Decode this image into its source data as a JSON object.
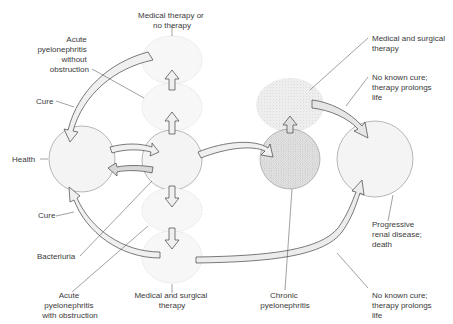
{
  "diagram": {
    "type": "state-transition",
    "nodes": [
      {
        "id": "health",
        "label": "Health"
      },
      {
        "id": "bacteriuria",
        "label": "Bacteriuria"
      },
      {
        "id": "acute_no_obstruction",
        "label": "Acute pyelonephritis without obstruction"
      },
      {
        "id": "medical_or_none",
        "label": "Medical therapy or no therapy"
      },
      {
        "id": "acute_obstruction",
        "label": "Acute pyelonephritis with obstruction"
      },
      {
        "id": "medical_surgical_bottom",
        "label": "Medical and surgical therapy"
      },
      {
        "id": "chronic",
        "label": "Chronic pyelonephritis"
      },
      {
        "id": "medical_surgical_top",
        "label": "Medical and surgical therapy"
      },
      {
        "id": "progressive",
        "label": "Progressive renal disease; death"
      }
    ],
    "labels": {
      "medical_or_none_l1": "Medical therapy or",
      "medical_or_none_l2": "no therapy",
      "acute_wo_l1": "Acute",
      "acute_wo_l2": "pyelonephritis",
      "acute_wo_l3": "without",
      "acute_wo_l4": "obstruction",
      "cure_top": "Cure",
      "health": "Health",
      "cure_bottom": "Cure",
      "bacteriuria": "Bacteriuria",
      "acute_w_l1": "Acute",
      "acute_w_l2": "pyelonephritis",
      "acute_w_l3": "with obstruction",
      "med_surg_bottom_l1": "Medical and surgical",
      "med_surg_bottom_l2": "therapy",
      "chronic_l1": "Chronic",
      "chronic_l2": "pyelonephritis",
      "med_surg_top_l1": "Medical and surgical",
      "med_surg_top_l2": "therapy",
      "no_cure_top_l1": "No known cure;",
      "no_cure_top_l2": "therapy prolongs",
      "no_cure_top_l3": "life",
      "progressive_l1": "Progressive",
      "progressive_l2": "renal disease;",
      "progressive_l3": "death",
      "no_cure_bottom_l1": "No known cure;",
      "no_cure_bottom_l2": "therapy prolongs",
      "no_cure_bottom_l3": "life"
    }
  }
}
